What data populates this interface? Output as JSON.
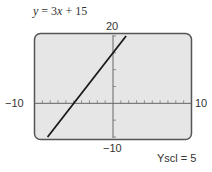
{
  "chart_data": {
    "type": "line",
    "title": "y = 3x + 15",
    "equation": {
      "slope": 3,
      "intercept": 15
    },
    "series": [
      {
        "name": "y = 3x + 15",
        "x": [
          -8.333,
          1.667
        ],
        "y": [
          -10,
          20
        ]
      }
    ],
    "xlim": [
      -10,
      10
    ],
    "ylim": [
      -10,
      20
    ],
    "xscl": 1,
    "yscl": 5,
    "tick_labels": {
      "x_min": "−10",
      "x_max": "10",
      "y_min": "−10",
      "y_max": "20"
    },
    "annotation": "Yscl = 5",
    "grid": false,
    "colors": {
      "screen": "#e6e6e6",
      "frame": "#555555",
      "line": "#1a1a1a",
      "axis": "#666666"
    }
  }
}
